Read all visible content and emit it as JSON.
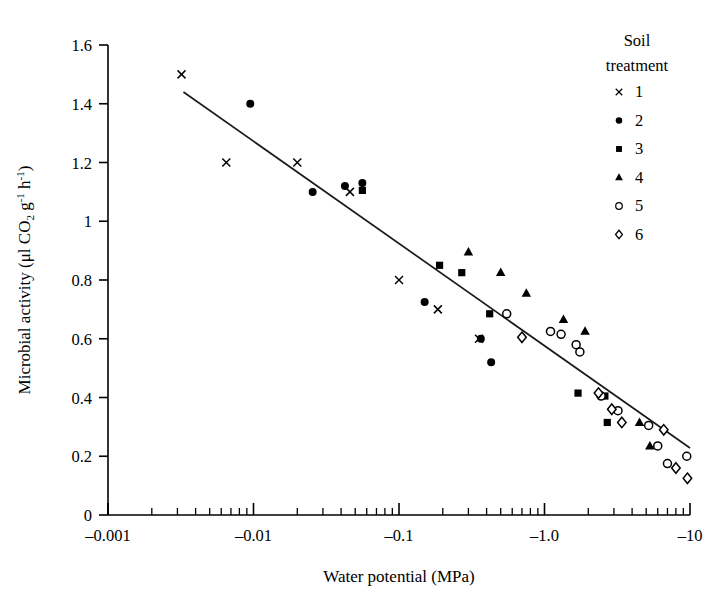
{
  "chart_data": {
    "type": "scatter",
    "title": "",
    "xlabel": "Water potential (MPa)",
    "ylabel": "Microbial activity (μl CO₂ g⁻¹ h⁻¹)",
    "x_scale": "log",
    "x_tick_labels": [
      "–0.001",
      "–0.01",
      "–0.1",
      "–1.0",
      "–10"
    ],
    "x_tick_values": [
      -0.001,
      -0.01,
      -0.1,
      -1.0,
      -10
    ],
    "y_tick_labels": [
      "0",
      "0.2",
      "0.4",
      "0.6",
      "0.8",
      "1",
      "1.2",
      "1.4",
      "1.6"
    ],
    "y_tick_values": [
      0,
      0.2,
      0.4,
      0.6,
      0.8,
      1.0,
      1.2,
      1.4,
      1.6
    ],
    "ylim": [
      0,
      1.6
    ],
    "grid": false,
    "legend_position": "top-right",
    "legend_title_line1": "Soil",
    "legend_title_line2": "treatment",
    "series": [
      {
        "name": "1",
        "marker": "cross",
        "points": [
          {
            "x": -0.0032,
            "y": 1.5
          },
          {
            "x": -0.0065,
            "y": 1.2
          },
          {
            "x": -0.02,
            "y": 1.2
          },
          {
            "x": -0.046,
            "y": 1.1
          },
          {
            "x": -0.1,
            "y": 0.8
          },
          {
            "x": -0.185,
            "y": 0.7
          },
          {
            "x": -0.355,
            "y": 0.6
          }
        ]
      },
      {
        "name": "2",
        "marker": "filled-circle",
        "points": [
          {
            "x": -0.0095,
            "y": 1.4
          },
          {
            "x": -0.0255,
            "y": 1.1
          },
          {
            "x": -0.0425,
            "y": 1.12
          },
          {
            "x": -0.056,
            "y": 1.13
          },
          {
            "x": -0.15,
            "y": 0.725
          },
          {
            "x": -0.365,
            "y": 0.6
          },
          {
            "x": -0.43,
            "y": 0.52
          }
        ]
      },
      {
        "name": "3",
        "marker": "filled-square",
        "points": [
          {
            "x": -0.056,
            "y": 1.105
          },
          {
            "x": -0.19,
            "y": 0.85
          },
          {
            "x": -0.27,
            "y": 0.825
          },
          {
            "x": -0.42,
            "y": 0.685
          },
          {
            "x": -1.7,
            "y": 0.415
          },
          {
            "x": -2.6,
            "y": 0.405
          },
          {
            "x": -2.7,
            "y": 0.315
          }
        ]
      },
      {
        "name": "4",
        "marker": "filled-triangle",
        "points": [
          {
            "x": -0.3,
            "y": 0.895
          },
          {
            "x": -0.5,
            "y": 0.825
          },
          {
            "x": -0.75,
            "y": 0.755
          },
          {
            "x": -1.35,
            "y": 0.665
          },
          {
            "x": -1.9,
            "y": 0.625
          },
          {
            "x": -4.5,
            "y": 0.315
          },
          {
            "x": -5.3,
            "y": 0.235
          }
        ]
      },
      {
        "name": "5",
        "marker": "open-circle",
        "points": [
          {
            "x": -0.55,
            "y": 0.685
          },
          {
            "x": -1.1,
            "y": 0.625
          },
          {
            "x": -1.3,
            "y": 0.615
          },
          {
            "x": -1.65,
            "y": 0.58
          },
          {
            "x": -1.75,
            "y": 0.555
          },
          {
            "x": -2.45,
            "y": 0.405
          },
          {
            "x": -3.2,
            "y": 0.355
          },
          {
            "x": -5.2,
            "y": 0.305
          },
          {
            "x": -6.0,
            "y": 0.235
          },
          {
            "x": -7.0,
            "y": 0.175
          },
          {
            "x": -9.5,
            "y": 0.2
          }
        ]
      },
      {
        "name": "6",
        "marker": "open-diamond",
        "points": [
          {
            "x": -0.7,
            "y": 0.605
          },
          {
            "x": -2.35,
            "y": 0.415
          },
          {
            "x": -2.9,
            "y": 0.36
          },
          {
            "x": -3.4,
            "y": 0.315
          },
          {
            "x": -6.6,
            "y": 0.29
          },
          {
            "x": -8.0,
            "y": 0.16
          },
          {
            "x": -9.6,
            "y": 0.125
          }
        ]
      }
    ],
    "trend_line": {
      "x_start": -0.0033,
      "y_start": 1.44,
      "x_end": -10.0,
      "y_end": 0.228
    }
  },
  "legend": {
    "title_line1": "Soil",
    "title_line2": "treatment",
    "items": [
      {
        "label": "1",
        "marker": "cross"
      },
      {
        "label": "2",
        "marker": "filled-circle"
      },
      {
        "label": "3",
        "marker": "filled-square"
      },
      {
        "label": "4",
        "marker": "filled-triangle"
      },
      {
        "label": "5",
        "marker": "open-circle"
      },
      {
        "label": "6",
        "marker": "open-diamond"
      }
    ]
  },
  "axes": {
    "x_title": "Water potential (MPa)",
    "y_title_parts": {
      "main": "Microbial activity (μl CO",
      "sub_2": "2",
      "mid": " g",
      "sup_g": "-1",
      "mid2": " h",
      "sup_h": "-1",
      "close": ")"
    },
    "x_ticks": [
      "–0.001",
      "–0.01",
      "–0.1",
      "–1.0",
      "–10"
    ],
    "y_ticks": [
      "1.6",
      "1.4",
      "1.2",
      "1",
      "0.8",
      "0.6",
      "0.4",
      "0.2",
      "0"
    ]
  }
}
